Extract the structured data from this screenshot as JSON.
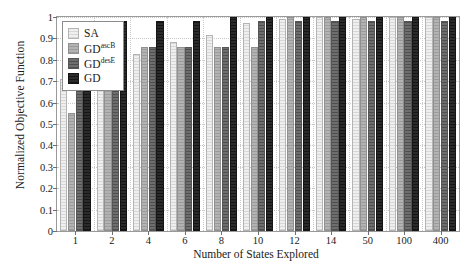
{
  "chart_data": {
    "type": "bar",
    "title": "",
    "xlabel": "Number of States Explored",
    "ylabel": "Normalized Objective Function",
    "categories": [
      "1",
      "2",
      "4",
      "6",
      "8",
      "10",
      "12",
      "14",
      "50",
      "100",
      "400"
    ],
    "ylim": [
      0,
      1
    ],
    "yticks": [
      "0",
      "0.1",
      "0.2",
      "0.3",
      "0.4",
      "0.5",
      "0.6",
      "0.7",
      "0.8",
      "0.9",
      "1"
    ],
    "ytick_values": [
      0,
      0.1,
      0.2,
      0.3,
      0.4,
      0.5,
      0.6,
      0.7,
      0.8,
      0.9,
      1
    ],
    "grid": true,
    "legend_position": "top-left",
    "series": [
      {
        "name": "SA",
        "color": "#efefef",
        "values": [
          0.71,
          0.745,
          0.825,
          0.885,
          0.915,
          0.97,
          0.99,
          1.0,
          0.99,
          1.0,
          1.0
        ]
      },
      {
        "name": "GD",
        "superscript": "ascB",
        "color": "#b3b3b3",
        "values": [
          0.55,
          0.83,
          0.86,
          0.86,
          0.86,
          0.86,
          1.0,
          1.0,
          1.0,
          1.0,
          1.0
        ]
      },
      {
        "name": "GD",
        "superscript": "desE",
        "color": "#6e6e6e",
        "values": [
          0.86,
          0.86,
          0.86,
          0.86,
          0.86,
          0.98,
          0.98,
          0.98,
          0.98,
          0.98,
          0.98
        ]
      },
      {
        "name": "GD",
        "superscript": "",
        "color": "#2b2b2b",
        "values": [
          0.98,
          0.98,
          0.98,
          0.98,
          1.0,
          1.0,
          1.0,
          1.0,
          1.0,
          1.0,
          1.0
        ]
      }
    ]
  }
}
